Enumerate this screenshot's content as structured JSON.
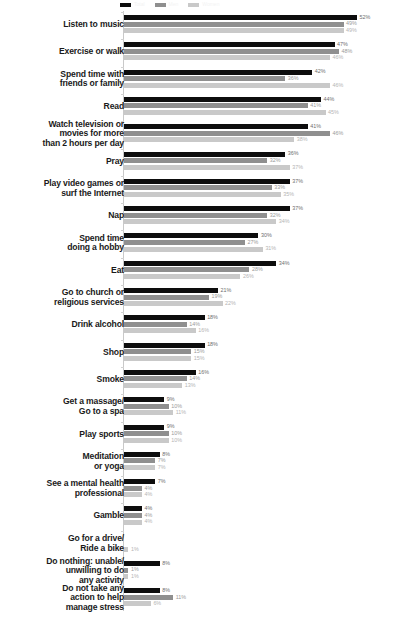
{
  "chart_data": {
    "type": "bar",
    "orientation": "horizontal",
    "title": "",
    "xlabel": "",
    "ylabel": "",
    "xlim": [
      0,
      60
    ],
    "grid": false,
    "value_suffix": "%",
    "legend_position": "top",
    "legend_visible_partial": true,
    "series": [
      {
        "name": "Total",
        "color": "#0d0d0d"
      },
      {
        "name": "Men",
        "color": "#8f8f8f"
      },
      {
        "name": "Women",
        "color": "#c9c9c9"
      }
    ],
    "categories": [
      "Listen to music",
      "Exercise or walk",
      "Spend time with\nfriends or family",
      "Read",
      "Watch television or\nmovies for more\nthan 2 hours per day",
      "Pray",
      "Play video games or\nsurf the Internet",
      "Nap",
      "Spend time\ndoing a hobby",
      "Eat",
      "Go to church or\nreligious services",
      "Drink alcohol",
      "Shop",
      "Smoke",
      "Get a massage/\nGo to a spa",
      "Play sports",
      "Meditation\nor yoga",
      "See a mental health\nprofessional",
      "Gamble",
      "Go for a drive/\nRide a bike",
      "Do nothing: unable/\nunwilling to do\nany activity",
      "Do not take any\naction to help\nmanage stress"
    ],
    "rows": [
      {
        "label": "Listen to music",
        "values": [
          52,
          49,
          49
        ],
        "labels": [
          "52%",
          "49%",
          "49%"
        ]
      },
      {
        "label": "Exercise or walk",
        "values": [
          47,
          48,
          46
        ],
        "labels": [
          "47%",
          "48%",
          "46%"
        ]
      },
      {
        "label": "Spend time with friends or family",
        "values": [
          42,
          36,
          46
        ],
        "labels": [
          "42%",
          "36%",
          "46%"
        ]
      },
      {
        "label": "Read",
        "values": [
          44,
          41,
          45
        ],
        "labels": [
          "44%",
          "41%",
          "45%"
        ]
      },
      {
        "label": "Watch television or movies for more than 2 hours per day",
        "values": [
          41,
          46,
          38
        ],
        "labels": [
          "41%",
          "46%",
          "38%"
        ]
      },
      {
        "label": "Pray",
        "values": [
          36,
          32,
          37
        ],
        "labels": [
          "36%",
          "32%",
          "37%"
        ]
      },
      {
        "label": "Play video games or surf the Internet",
        "values": [
          37,
          33,
          35
        ],
        "labels": [
          "37%",
          "33%",
          "35%"
        ]
      },
      {
        "label": "Nap",
        "values": [
          37,
          32,
          34
        ],
        "labels": [
          "37%",
          "32%",
          "34%"
        ]
      },
      {
        "label": "Spend time doing a hobby",
        "values": [
          30,
          27,
          31
        ],
        "labels": [
          "30%",
          "27%",
          "31%"
        ]
      },
      {
        "label": "Eat",
        "values": [
          34,
          28,
          26
        ],
        "labels": [
          "34%",
          "28%",
          "26%"
        ]
      },
      {
        "label": "Go to church or religious services",
        "values": [
          21,
          19,
          22
        ],
        "labels": [
          "21%",
          "19%",
          "22%"
        ]
      },
      {
        "label": "Drink alcohol",
        "values": [
          18,
          14,
          16
        ],
        "labels": [
          "18%",
          "14%",
          "16%"
        ]
      },
      {
        "label": "Shop",
        "values": [
          18,
          15,
          15
        ],
        "labels": [
          "18%",
          "15%",
          "15%"
        ]
      },
      {
        "label": "Smoke",
        "values": [
          16,
          14,
          13
        ],
        "labels": [
          "16%",
          "14%",
          "13%"
        ]
      },
      {
        "label": "Get a massage/ Go to a spa",
        "values": [
          9,
          10,
          11
        ],
        "labels": [
          "9%",
          "10%",
          "11%"
        ]
      },
      {
        "label": "Play sports",
        "values": [
          9,
          10,
          10
        ],
        "labels": [
          "9%",
          "10%",
          "10%"
        ]
      },
      {
        "label": "Meditation or yoga",
        "values": [
          8,
          7,
          7
        ],
        "labels": [
          "8%",
          "7%",
          "7%"
        ]
      },
      {
        "label": "See a mental health professional",
        "values": [
          7,
          4,
          4
        ],
        "labels": [
          "7%",
          "4%",
          "4%"
        ]
      },
      {
        "label": "Gamble",
        "values": [
          4,
          4,
          4
        ],
        "labels": [
          "4%",
          "4%",
          "4%"
        ]
      },
      {
        "label": "Go for a drive/ Ride a bike",
        "values": [
          0,
          0,
          1
        ],
        "labels": [
          "",
          "",
          "1%"
        ]
      },
      {
        "label": "Do nothing: unable/ unwilling to do any activity",
        "values": [
          8,
          1,
          1
        ],
        "labels": [
          "8%",
          "1%",
          "1%"
        ]
      },
      {
        "label": "Do not take any action to help manage stress",
        "values": [
          8,
          11,
          6
        ],
        "labels": [
          "8%",
          "11%",
          "6%"
        ]
      }
    ]
  },
  "legend": {
    "items": [
      {
        "label": "Total",
        "color": "#0d0d0d"
      },
      {
        "label": "Men",
        "color": "#8f8f8f"
      },
      {
        "label": "Women",
        "color": "#c9c9c9"
      }
    ]
  }
}
